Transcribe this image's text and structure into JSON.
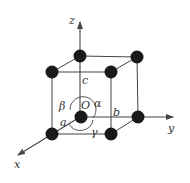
{
  "diagram": {
    "type": "unit-cell",
    "colors": {
      "line": "#444444",
      "atom": "#1a1a1a",
      "text": "#333333",
      "background": "#ffffff"
    },
    "axes": [
      {
        "name": "x",
        "label": "x"
      },
      {
        "name": "y",
        "label": "y"
      },
      {
        "name": "z",
        "label": "z"
      }
    ],
    "origin_label": "O",
    "edge_labels": {
      "a": "a",
      "b": "b",
      "c": "c"
    },
    "angle_labels": {
      "alpha": "α",
      "beta": "β",
      "gamma": "γ"
    },
    "atoms": [
      {
        "id": "origin",
        "position": "back-bottom-left"
      },
      {
        "id": "top-back-left",
        "position": "back-top-left"
      },
      {
        "id": "top-back-right",
        "position": "back-top-right"
      },
      {
        "id": "top-front-left",
        "position": "front-top-left"
      },
      {
        "id": "top-front-right",
        "position": "front-top-right"
      },
      {
        "id": "bottom-back-right",
        "position": "back-bottom-right"
      },
      {
        "id": "bottom-front-left",
        "position": "front-bottom-left"
      },
      {
        "id": "bottom-front-right",
        "position": "front-bottom-right"
      }
    ]
  }
}
